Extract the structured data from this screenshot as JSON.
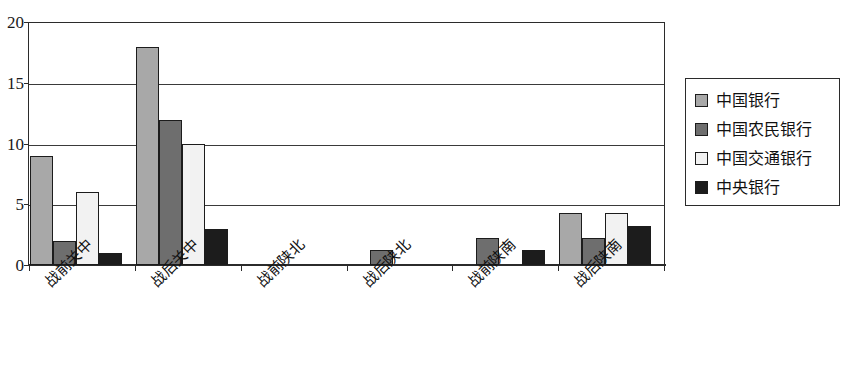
{
  "chart_data": {
    "type": "bar",
    "title": "",
    "xlabel": "",
    "ylabel": "",
    "ylim": [
      0,
      20
    ],
    "yticks": [
      0,
      5,
      10,
      15,
      20
    ],
    "ytick_labels": [
      "0",
      "5",
      "10",
      "15",
      "20"
    ],
    "grid": true,
    "legend_position": "right",
    "categories": [
      "战前关中",
      "战后关中",
      "战前陕北",
      "战后陕北",
      "战前陕南",
      "战后陕南"
    ],
    "series": [
      {
        "name": "中国银行",
        "color": "#a8a8a8",
        "values": [
          9,
          18,
          0,
          0,
          0,
          4.3
        ]
      },
      {
        "name": "中国农民银行",
        "color": "#6e6e6e",
        "values": [
          2,
          12,
          0,
          1.2,
          2.2,
          2.2
        ]
      },
      {
        "name": "中国交通银行",
        "color": "#f2f2f2",
        "values": [
          6,
          10,
          0,
          0,
          0,
          4.3
        ]
      },
      {
        "name": "中央银行",
        "color": "#1c1c1c",
        "values": [
          1,
          3,
          0,
          0,
          1.2,
          3.2
        ]
      }
    ]
  },
  "legend": {
    "items": [
      {
        "label": "中国银行"
      },
      {
        "label": "中国农民银行"
      },
      {
        "label": "中国交通银行"
      },
      {
        "label": "中央银行"
      }
    ]
  },
  "axis": {
    "y_labels": [
      "20",
      "15",
      "10",
      "5",
      "0"
    ]
  }
}
